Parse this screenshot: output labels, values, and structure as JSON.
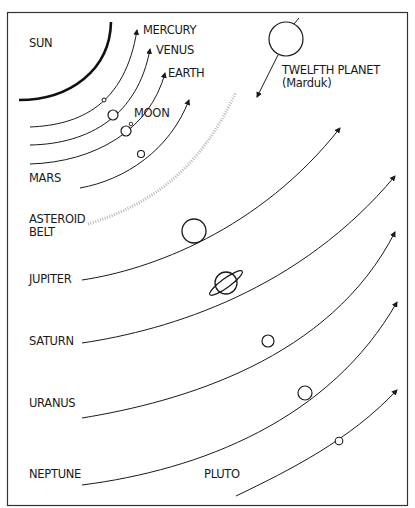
{
  "diagram": {
    "type": "solar-system-orbits",
    "colors": {
      "line": "#1a1a1a",
      "asteroid": "#b8b8b8",
      "background": "#ffffff"
    },
    "labels": {
      "sun": "SUN",
      "mercury": "MERCURY",
      "venus": "VENUS",
      "earth": "EARTH",
      "moon": "MOON",
      "mars": "MARS",
      "asteroid_belt_1": "ASTEROID",
      "asteroid_belt_2": "BELT",
      "jupiter": "JUPITER",
      "saturn": "SATURN",
      "uranus": "URANUS",
      "neptune": "NEPTUNE",
      "pluto": "PLUTO",
      "twelfth_planet": "TWELFTH PLANET",
      "twelfth_planet_alias": "(Marduk)"
    },
    "bodies": [
      {
        "name": "Sun",
        "shape": "arc"
      },
      {
        "name": "Mercury",
        "size": "tiny"
      },
      {
        "name": "Venus",
        "size": "small"
      },
      {
        "name": "Earth",
        "size": "small"
      },
      {
        "name": "Moon",
        "size": "tiny"
      },
      {
        "name": "Mars",
        "size": "small"
      },
      {
        "name": "Asteroid Belt",
        "shape": "dotted-band"
      },
      {
        "name": "Jupiter",
        "size": "large"
      },
      {
        "name": "Saturn",
        "size": "large",
        "rings": true
      },
      {
        "name": "Uranus",
        "size": "medium"
      },
      {
        "name": "Neptune",
        "size": "medium"
      },
      {
        "name": "Pluto",
        "size": "tiny"
      },
      {
        "name": "Twelfth Planet (Marduk)",
        "size": "large",
        "orbit": "retrograde-crossing"
      }
    ]
  }
}
